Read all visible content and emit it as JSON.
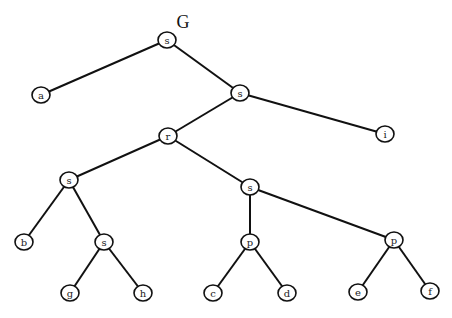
{
  "title": "G",
  "title_pos": {
    "x": 183,
    "y": 28
  },
  "colors": {
    "stroke": "#111111",
    "fill": "#ffffff",
    "text": "#222222"
  },
  "nodes": [
    {
      "id": "s1",
      "label": "s",
      "x": 167,
      "y": 40
    },
    {
      "id": "a",
      "label": "a",
      "x": 41,
      "y": 95
    },
    {
      "id": "s2",
      "label": "s",
      "x": 240,
      "y": 93
    },
    {
      "id": "r",
      "label": "r",
      "x": 168,
      "y": 136
    },
    {
      "id": "i",
      "label": "i",
      "x": 385,
      "y": 134
    },
    {
      "id": "s3",
      "label": "s",
      "x": 69,
      "y": 180
    },
    {
      "id": "s4",
      "label": "s",
      "x": 250,
      "y": 187
    },
    {
      "id": "b",
      "label": "b",
      "x": 24,
      "y": 242
    },
    {
      "id": "s5",
      "label": "s",
      "x": 104,
      "y": 242
    },
    {
      "id": "p1",
      "label": "p",
      "x": 250,
      "y": 242
    },
    {
      "id": "p2",
      "label": "p",
      "x": 394,
      "y": 240
    },
    {
      "id": "g",
      "label": "g",
      "x": 70,
      "y": 293
    },
    {
      "id": "h",
      "label": "h",
      "x": 143,
      "y": 293
    },
    {
      "id": "c",
      "label": "c",
      "x": 213,
      "y": 293
    },
    {
      "id": "d",
      "label": "d",
      "x": 287,
      "y": 293
    },
    {
      "id": "e",
      "label": "e",
      "x": 358,
      "y": 292
    },
    {
      "id": "f",
      "label": "f",
      "x": 430,
      "y": 291
    }
  ],
  "edges": [
    [
      "s1",
      "a"
    ],
    [
      "s1",
      "s2"
    ],
    [
      "s2",
      "r"
    ],
    [
      "s2",
      "i"
    ],
    [
      "r",
      "s3"
    ],
    [
      "r",
      "s4"
    ],
    [
      "s3",
      "b"
    ],
    [
      "s3",
      "s5"
    ],
    [
      "s5",
      "g"
    ],
    [
      "s5",
      "h"
    ],
    [
      "s4",
      "p1"
    ],
    [
      "s4",
      "p2"
    ],
    [
      "p1",
      "c"
    ],
    [
      "p1",
      "d"
    ],
    [
      "p2",
      "e"
    ],
    [
      "p2",
      "f"
    ]
  ]
}
